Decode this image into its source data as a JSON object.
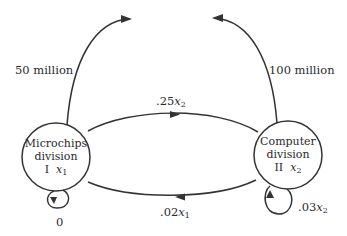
{
  "diagram": {
    "type": "flow-network",
    "stroke_color": "#333333",
    "nodes": [
      {
        "id": "I",
        "name_line1": "Microchips",
        "name_line2": "division",
        "roman": "I",
        "variable": "x",
        "subscript": "1"
      },
      {
        "id": "II",
        "name_line1": "Computer",
        "name_line2": "division",
        "roman": "II",
        "variable": "x",
        "subscript": "2"
      }
    ],
    "edges": [
      {
        "from": "I",
        "to": "external",
        "label": "50 million"
      },
      {
        "from": "II",
        "to": "external",
        "label": "100 million"
      },
      {
        "from": "I",
        "to": "II",
        "label_coef": ".25",
        "label_var": "x",
        "label_sub": "2"
      },
      {
        "from": "II",
        "to": "I",
        "label_coef": ".02",
        "label_var": "x",
        "label_sub": "1"
      },
      {
        "from": "I",
        "to": "I",
        "label": "0"
      },
      {
        "from": "II",
        "to": "II",
        "label_coef": ".03",
        "label_var": "x",
        "label_sub": "2"
      }
    ]
  }
}
